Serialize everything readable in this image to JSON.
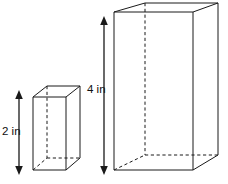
{
  "figure": {
    "background_color": "#ffffff",
    "line_color": "#1a1a1a",
    "units": "in",
    "shapes": [
      {
        "id": "small-prism",
        "name": "small-rectangular-prism",
        "label": "2 in",
        "height_value": 2,
        "front_face": {
          "left": 33,
          "right": 66,
          "top": 97,
          "bottom": 170
        },
        "depth_offset": {
          "dx": 14,
          "dy": -11
        }
      },
      {
        "id": "large-prism",
        "name": "large-rectangular-prism",
        "label": "4 in",
        "height_value": 4,
        "front_face": {
          "left": 114,
          "right": 193,
          "top": 12,
          "bottom": 170
        },
        "depth_offset": {
          "dx": 31,
          "dy": -9
        }
      }
    ],
    "dimensions": [
      {
        "id": "small-height-dimension",
        "name": "height-dimension-2in",
        "label": "2 in",
        "axis_x": 19,
        "y_top": 93,
        "y_bottom": 172,
        "text_x": 2,
        "text_y": 132
      },
      {
        "id": "large-height-dimension",
        "name": "height-dimension-4in",
        "label": "4 in",
        "axis_x": 104,
        "y_top": 19,
        "y_bottom": 172,
        "text_x": 87,
        "text_y": 90
      }
    ]
  }
}
